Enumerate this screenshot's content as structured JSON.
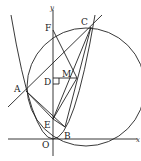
{
  "figure": {
    "axes": {
      "x_label": "x",
      "y_label": "y",
      "origin_label": "O"
    },
    "points": {
      "A": "A",
      "B": "B",
      "C": "C",
      "D": "D",
      "E": "E",
      "F": "F",
      "M": "M",
      "O": "O"
    }
  }
}
